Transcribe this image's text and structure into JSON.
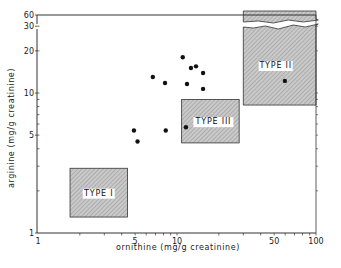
{
  "chart_data": {
    "type": "scatter",
    "title": "",
    "xlabel": "ornithine (mg/g creatinine)",
    "ylabel": "arginine (mg/g creatinine)",
    "xscale": "log",
    "yscale": "log",
    "xlim": [
      1,
      100
    ],
    "ylim": [
      1,
      60
    ],
    "y_axis_break": [
      30,
      60
    ],
    "grid": false,
    "x_ticks": [
      {
        "value": 1,
        "label": "1"
      },
      {
        "value": 5,
        "label": "5"
      },
      {
        "value": 10,
        "label": "10"
      },
      {
        "value": 50,
        "label": "50"
      },
      {
        "value": 100,
        "label": "100"
      }
    ],
    "y_ticks": [
      {
        "value": 1,
        "label": "1"
      },
      {
        "value": 5,
        "label": "5"
      },
      {
        "value": 10,
        "label": "10"
      },
      {
        "value": 20,
        "label": "20"
      },
      {
        "value": 30,
        "label": "30"
      },
      {
        "value": 60,
        "label": "60"
      }
    ],
    "series": [
      {
        "name": "patients",
        "points": [
          {
            "x": 6.7,
            "y": 13.0
          },
          {
            "x": 8.2,
            "y": 11.8
          },
          {
            "x": 11.0,
            "y": 18.0
          },
          {
            "x": 12.6,
            "y": 15.1
          },
          {
            "x": 13.7,
            "y": 15.5
          },
          {
            "x": 15.4,
            "y": 13.9
          },
          {
            "x": 11.8,
            "y": 11.6
          },
          {
            "x": 15.4,
            "y": 10.7
          },
          {
            "x": 4.9,
            "y": 5.4
          },
          {
            "x": 5.2,
            "y": 4.5
          },
          {
            "x": 8.3,
            "y": 5.4
          },
          {
            "x": 11.6,
            "y": 5.7
          },
          {
            "x": 59.7,
            "y": 12.2
          }
        ]
      }
    ],
    "regions": [
      {
        "label": "TYPE I",
        "x": [
          1.7,
          4.4
        ],
        "y": [
          1.3,
          2.9
        ]
      },
      {
        "label": "TYPE III",
        "x": [
          10.8,
          28
        ],
        "y": [
          4.4,
          9.0
        ]
      },
      {
        "label": "TYPE II",
        "x": [
          30,
          100
        ],
        "y": [
          8.2,
          60
        ],
        "broken": true
      }
    ],
    "annotations": [
      "TYPE I",
      "TYPE II",
      "TYPE III"
    ]
  },
  "labels": {
    "xlabel": "ornithine (mg/g creatinine)",
    "ylabel": "arginine (mg/g creatinine)",
    "type1": "TYPE I",
    "type2": "TYPE II",
    "type3": "TYPE III"
  }
}
